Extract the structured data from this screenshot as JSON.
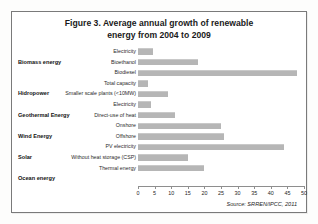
{
  "figure": {
    "title_line1": "Figure 3. Average annual growth of renewable",
    "title_line2": "energy from 2004 to 2009",
    "source": "Source: SRREN/IPCC, 2011"
  },
  "groups": [
    {
      "label": "Biomass energy",
      "row_index": 1
    },
    {
      "label": "Hidropower",
      "row_index": 4
    },
    {
      "label": "Geothermal Energy",
      "row_index": 6
    },
    {
      "label": "Wind Energy",
      "row_index": 8
    },
    {
      "label": "Solar",
      "row_index": 10
    },
    {
      "label": "Ocean energy",
      "row_index": 12
    }
  ],
  "chart_data": {
    "type": "bar",
    "orientation": "horizontal",
    "title": "Figure 3. Average annual growth of renewable energy from 2004 to 2009",
    "xlabel": "",
    "ylabel": "",
    "xlim": [
      0,
      50
    ],
    "xticks": [
      0,
      5,
      10,
      15,
      20,
      25,
      30,
      35,
      40,
      45,
      50
    ],
    "grid": false,
    "legend": "none",
    "bar_color": "#b6b6b6",
    "categories": [
      "Electricity",
      "Bioethanol",
      "Biodiesel",
      "Total capacity",
      "Smaller scale plants (<10MW)",
      "Electricity",
      "Direct-use of heat",
      "Onshore",
      "Offshore",
      "PV electricity",
      "Without heat storage (CSP)",
      "Thermal energy",
      ""
    ],
    "values": [
      4.5,
      18,
      48,
      3,
      9,
      4,
      11,
      25,
      26,
      44,
      15,
      20,
      0
    ]
  }
}
